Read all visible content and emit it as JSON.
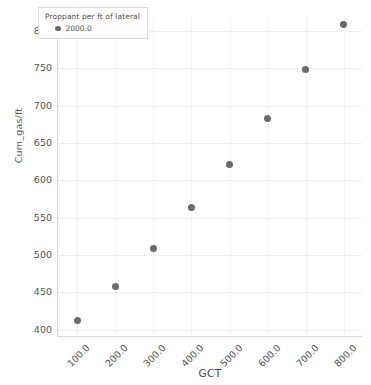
{
  "chart_data": {
    "type": "scatter",
    "title": "",
    "xlabel": "GCT",
    "ylabel": "Cum_gas/ft",
    "xlim": [
      50,
      850
    ],
    "ylim": [
      390,
      820
    ],
    "grid": true,
    "x_tick_labels": [
      "100.0",
      "200.0",
      "300.0",
      "400.0",
      "500.0",
      "600.0",
      "700.0",
      "800.0"
    ],
    "x_ticks": [
      100,
      200,
      300,
      400,
      500,
      600,
      700,
      800
    ],
    "y_tick_labels": [
      "400",
      "450",
      "500",
      "550",
      "600",
      "650",
      "700",
      "750",
      "800"
    ],
    "y_ticks": [
      400,
      450,
      500,
      550,
      600,
      650,
      700,
      750,
      800
    ],
    "x": [
      100,
      200,
      300,
      400,
      500,
      600,
      700,
      800
    ],
    "values": [
      412,
      457,
      508,
      563,
      621,
      683,
      748,
      808
    ],
    "series": [
      {
        "name": "2000.0",
        "color": "#6b6b6b",
        "x": [
          100,
          200,
          300,
          400,
          500,
          600,
          700,
          800
        ],
        "values": [
          412,
          457,
          508,
          563,
          621,
          683,
          748,
          808
        ]
      }
    ],
    "legend": {
      "title": "Proppant per ft of lateral",
      "position": "upper-left-inside",
      "entries": [
        {
          "label": "2000.0",
          "color": "#6b6b6b"
        }
      ]
    },
    "colors": {
      "marker": "#6b6b6b",
      "grid": "#eeeeee",
      "axis": "#d7d7d7",
      "tick_text": "#555555",
      "axis_title": "#4a4a4a",
      "background": "#ffffff"
    }
  }
}
